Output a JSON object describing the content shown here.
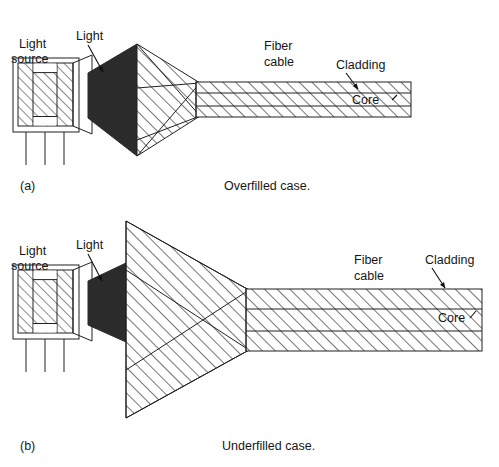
{
  "figure": {
    "background_color": "#ffffff",
    "ink_color": "#161616",
    "fill_dark_color": "#2b2b2b"
  },
  "panels": [
    {
      "id": "a",
      "panel_label": "(a)",
      "caption": "Overfilled case.",
      "labels": {
        "light_source": "Light\nsource",
        "light_source_line1": "Light",
        "light_source_line2": "source",
        "light": "Light",
        "fiber_cable_line1": "Fiber",
        "fiber_cable_line2": "cable",
        "cladding": "Cladding",
        "core": "Core"
      }
    },
    {
      "id": "b",
      "panel_label": "(b)",
      "caption": "Underfilled case.",
      "labels": {
        "light_source": "Light\nsource",
        "light_source_line1": "Light",
        "light_source_line2": "source",
        "light": "Light",
        "fiber_cable_line1": "Fiber",
        "fiber_cable_line2": "cable",
        "cladding": "Cladding",
        "core": "Core"
      }
    }
  ]
}
